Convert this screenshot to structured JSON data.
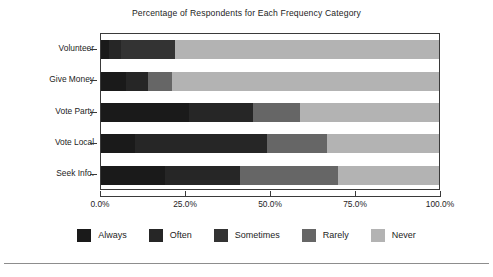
{
  "chart_data": {
    "type": "bar",
    "orientation": "horizontal",
    "stacked": true,
    "normalized": true,
    "title": "Percentage of Respondents for Each Frequency Category",
    "xlabel": "",
    "ylabel": "",
    "xlim": [
      0,
      100
    ],
    "grid": false,
    "legend_position": "bottom",
    "xticklabels": [
      "0.0%",
      "25.0%",
      "50.0%",
      "75.0%",
      "100.0%"
    ],
    "xtickvalues": [
      0,
      25,
      50,
      75,
      100
    ],
    "categories": [
      "Volunteer",
      "Give Money",
      "Vote Party",
      "Vote Local",
      "Seek Info."
    ],
    "series": [
      {
        "name": "Always",
        "color": "#1a1a1a",
        "values": [
          2.5,
          7.5,
          26.0,
          10.0,
          19.0
        ]
      },
      {
        "name": "Often",
        "color": "#262626",
        "values": [
          3.5,
          6.5,
          19.0,
          39.0,
          22.0
        ]
      },
      {
        "name": "Sometimes",
        "color": "#333333",
        "values": [
          16.0,
          0.0,
          0.0,
          0.0,
          0.0
        ]
      },
      {
        "name": "Rarely",
        "color": "#666666",
        "values": [
          0.0,
          7.0,
          14.0,
          18.0,
          29.0
        ]
      },
      {
        "name": "Never",
        "color": "#b3b3b3",
        "values": [
          78.0,
          79.0,
          41.0,
          33.0,
          30.0
        ]
      }
    ]
  },
  "legend": {
    "items": [
      {
        "label": "Always",
        "color": "#1a1a1a"
      },
      {
        "label": "Often",
        "color": "#262626"
      },
      {
        "label": "Sometimes",
        "color": "#333333"
      },
      {
        "label": "Rarely",
        "color": "#666666"
      },
      {
        "label": "Never",
        "color": "#b3b3b3"
      }
    ]
  }
}
